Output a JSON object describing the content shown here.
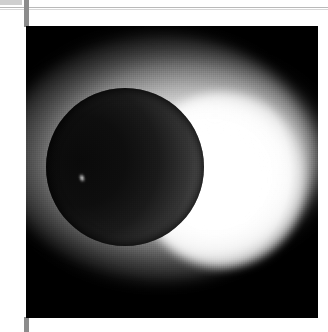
{
  "page": {
    "background_color": "#ffffff",
    "width": 328,
    "height": 332
  },
  "scan_artifacts": {
    "top_rule_color": "#b9b9b9",
    "binding_bar_color": "#8c8c8c",
    "corner_tick_color": "#cfcfcf"
  },
  "photo": {
    "caption": "",
    "alt_text": "Total solar eclipse: dark lunar disk surrounded by a bright white corona",
    "plate_background_color": "#000000",
    "subject": "total-solar-eclipse",
    "elements": {
      "moon_disk_label": "lunar disk",
      "corona_label": "solar corona",
      "limb_ring_label": "chromospheric limb ring",
      "prominence_label": "solar prominence"
    },
    "colors": {
      "corona_highlight": "#ffffff",
      "corona_mid": "#e6e6e6",
      "moon_shadow": "#0a0a0a",
      "moon_edge": "#8c8c8c"
    }
  }
}
